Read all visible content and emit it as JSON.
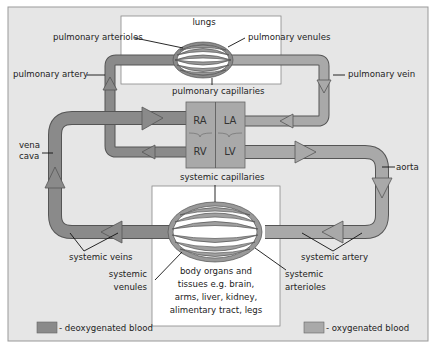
{
  "diagram": {
    "organs": {
      "lungs": "lungs",
      "body": [
        "body organs and",
        "tissues e.g. brain,",
        "arms, liver, kidney,",
        "alimentary tract, legs"
      ]
    },
    "heart_chambers": {
      "ra": "RA",
      "la": "LA",
      "rv": "RV",
      "lv": "LV"
    },
    "labels": {
      "pulmonary_arterioles": "pulmonary arterioles",
      "pulmonary_venules": "pulmonary venules",
      "pulmonary_artery": "pulmonary artery",
      "pulmonary_vein": "pulmonary vein",
      "pulmonary_capillaries": "pulmonary capillaries",
      "vena_cava_1": "vena",
      "vena_cava_2": "cava",
      "aorta": "aorta",
      "systemic_capillaries": "systemic capillaries",
      "systemic_veins": "systemic veins",
      "systemic_artery": "systemic artery",
      "systemic_venules_1": "systemic",
      "systemic_venules_2": "venules",
      "systemic_arterioles_1": "systemic",
      "systemic_arterioles_2": "arterioles"
    },
    "legend": [
      {
        "label": "- deoxygenated blood",
        "color": "#8a8a8a"
      },
      {
        "label": "- oxygenated blood",
        "color": "#a9a9a9"
      }
    ],
    "colors": {
      "background": "#e6e6e6",
      "box": "#ffffff",
      "deoxygenated": "#8a8a8a",
      "oxygenated": "#a9a9a9",
      "outline": "#555555"
    }
  }
}
